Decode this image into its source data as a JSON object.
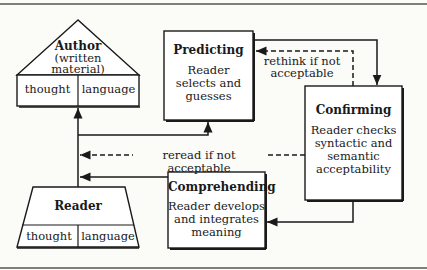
{
  "diagram": {
    "author": {
      "title": "Author",
      "subtitle_line1": "(written",
      "subtitle_line2": "material)",
      "left_cell": "thought",
      "right_cell": "language"
    },
    "reader": {
      "title": "Reader",
      "left_cell": "thought",
      "right_cell": "language"
    },
    "predicting": {
      "title": "Predicting",
      "line1": "Reader",
      "line2": "selects and",
      "line3": "guesses"
    },
    "confirming": {
      "title": "Confirming",
      "line1": "Reader checks",
      "line2": "syntactic and",
      "line3": "semantic",
      "line4": "acceptability"
    },
    "comprehending": {
      "title": "Comprehending",
      "line1": "Reader develops",
      "line2": "and integrates",
      "line3": "meaning"
    },
    "edges": {
      "rethink_line1": "rethink if not",
      "rethink_line2": "acceptable",
      "reread": "reread if not acceptable"
    }
  }
}
